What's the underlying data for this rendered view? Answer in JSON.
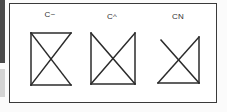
{
  "figure": {
    "labels": [
      "C~",
      "C^",
      "CN"
    ],
    "stroke_color": "#2b2b2b",
    "frame_color": "#3a3a3a",
    "margin_strips": {
      "dark": "#4a4a4a",
      "light": "#d4d4d4"
    },
    "shapes": [
      {
        "label": "C~",
        "edges": [
          "top",
          "left",
          "bottom"
        ],
        "diagonals": [
          "top-left-to-bottom-right",
          "top-right-to-bottom-left"
        ]
      },
      {
        "label": "C^",
        "edges": [
          "left",
          "right",
          "bottom"
        ],
        "diagonals": [
          "top-left-to-bottom-right",
          "top-right-to-bottom-left"
        ]
      },
      {
        "label": "CN",
        "edges": [
          "right",
          "bottom"
        ],
        "diagonals": [
          "top-left-to-bottom-right",
          "top-right-to-bottom-left"
        ]
      }
    ]
  }
}
